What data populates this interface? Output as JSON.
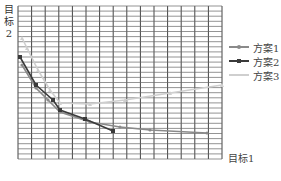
{
  "chart_data": {
    "type": "line",
    "title": "",
    "xlabel": "目标1",
    "ylabel": "目标2",
    "ylabel_chars": [
      "目",
      "标",
      "2"
    ],
    "grid": true,
    "grid_columns": 15,
    "grid_rows": 30,
    "legend_position": "right",
    "axis_ranges_px": {
      "x": [
        18,
        222
      ],
      "y": [
        6,
        159
      ]
    },
    "series": [
      {
        "name": "方案1",
        "color": "#8a8a8a",
        "marker": "dot",
        "points_px": [
          [
            22,
            65
          ],
          [
            36,
            88
          ],
          [
            48,
            100
          ],
          [
            60,
            112
          ],
          [
            90,
            122
          ],
          [
            120,
            127
          ],
          [
            150,
            130
          ],
          [
            207,
            133
          ]
        ]
      },
      {
        "name": "方案2",
        "color": "#3a3a3a",
        "marker": "square",
        "points_px": [
          [
            20,
            57
          ],
          [
            36,
            85
          ],
          [
            53,
            100
          ],
          [
            60,
            110
          ],
          [
            85,
            119
          ],
          [
            113,
            131
          ]
        ]
      },
      {
        "name": "方案3",
        "color": "#cfcfcf",
        "marker": "triangle",
        "points_px": [
          [
            22,
            38
          ],
          [
            27,
            48
          ],
          [
            38,
            70
          ],
          [
            50,
            90
          ],
          [
            60,
            103
          ],
          [
            90,
            104
          ],
          [
            125,
            100
          ],
          [
            170,
            93
          ],
          [
            222,
            85
          ]
        ]
      }
    ]
  },
  "labels": {
    "y_axis": "目标2",
    "x_axis": "目标1"
  },
  "legend": [
    {
      "label": "方案1",
      "color": "#8a8a8a"
    },
    {
      "label": "方案2",
      "color": "#3a3a3a"
    },
    {
      "label": "方案3",
      "color": "#cfcfcf"
    }
  ]
}
